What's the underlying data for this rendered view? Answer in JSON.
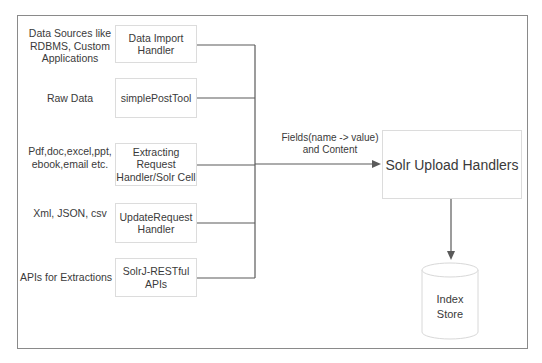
{
  "diagram": {
    "sources": [
      {
        "label_lines": [
          "Data Sources like",
          "RDBMS, Custom",
          "Applications"
        ]
      },
      {
        "label_lines": [
          "Raw Data"
        ]
      },
      {
        "label_lines": [
          "Pdf,doc,excel,ppt,",
          "ebook,email etc."
        ]
      },
      {
        "label_lines": [
          "Xml, JSON, csv"
        ]
      },
      {
        "label_lines": [
          "APIs for Extractions"
        ]
      }
    ],
    "handlers": [
      {
        "label_lines": [
          "Data Import",
          "Handler"
        ]
      },
      {
        "label_lines": [
          "simplePostTool"
        ]
      },
      {
        "label_lines": [
          "Extracting",
          "Request",
          "Handler/Solr Cell"
        ]
      },
      {
        "label_lines": [
          "UpdateRequest",
          "Handler"
        ]
      },
      {
        "label_lines": [
          "SolrJ-RESTful",
          "APIs"
        ]
      }
    ],
    "flow_label_lines": [
      "Fields(name -> value)",
      "and Content"
    ],
    "upload_handler": "Solr Upload Handlers",
    "index_store_lines": [
      "Index",
      "Store"
    ],
    "colors": {
      "frame": "#8a8a8a",
      "box_border": "#dcdcdc",
      "connector": "#5a5a5a",
      "text": "#3a3a3a"
    }
  }
}
